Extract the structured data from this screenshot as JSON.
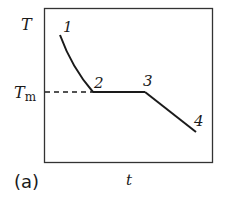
{
  "figure": {
    "panel_label": "(a)",
    "y_axis_label": "T",
    "x_axis_label": "t",
    "melting_temp_label": {
      "main": "T",
      "subscript": "m"
    },
    "points": [
      {
        "id": "1",
        "label": "1"
      },
      {
        "id": "2",
        "label": "2"
      },
      {
        "id": "3",
        "label": "3"
      },
      {
        "id": "4",
        "label": "4"
      }
    ],
    "colors": {
      "line": "#1a1a1a",
      "frame": "#333333",
      "background": "#ffffff"
    }
  }
}
